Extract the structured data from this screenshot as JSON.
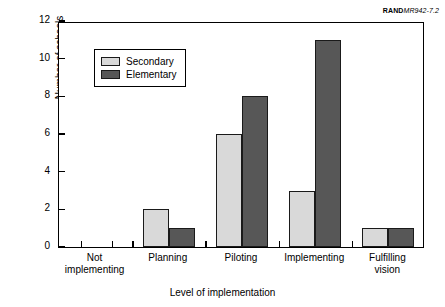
{
  "source_credit": {
    "brand": "RAND",
    "figure_id": "MR942-7.2"
  },
  "legend": {
    "position": "inside-top-left",
    "entries": [
      {
        "label": "Secondary",
        "color": "#d9d9d9"
      },
      {
        "label": "Elementary",
        "color": "#575757"
      }
    ]
  },
  "chart_data": {
    "type": "bar",
    "title": "",
    "subtitle": "",
    "xlabel": "Level of implementation",
    "ylabel": "Number of schools",
    "categories": [
      "Not implementing",
      "Planning",
      "Piloting",
      "Implementing",
      "Fulfilling vision"
    ],
    "category_lines": [
      [
        "Not",
        "implementing"
      ],
      [
        "Planning",
        ""
      ],
      [
        "Piloting",
        ""
      ],
      [
        "Implementing",
        ""
      ],
      [
        "Fulfilling",
        "vision"
      ]
    ],
    "series": [
      {
        "name": "Secondary",
        "color": "#d9d9d9",
        "values": [
          0,
          2,
          6,
          3,
          1
        ]
      },
      {
        "name": "Elementary",
        "color": "#575757",
        "values": [
          0,
          1,
          8,
          11,
          1
        ]
      }
    ],
    "ylim": [
      0,
      12
    ],
    "yticks": [
      0,
      2,
      4,
      6,
      8,
      10,
      12
    ],
    "ytick_labels": [
      "0",
      "2",
      "4",
      "6",
      "8",
      "10",
      "12"
    ],
    "grid": false,
    "legend_position": "upper left inside",
    "grouped": true
  }
}
